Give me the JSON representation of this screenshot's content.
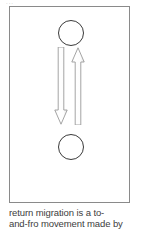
{
  "artifact": {
    "text": "..."
  },
  "figure": {
    "frame": {
      "border_color": "#8a8a8a",
      "background": "#ffffff"
    },
    "nodes": [
      {
        "name": "origin",
        "shape": "circle",
        "label": "",
        "position": "top",
        "stroke_color": "#3a3a3a"
      },
      {
        "name": "destination",
        "shape": "circle",
        "label": "",
        "position": "bottom",
        "stroke_color": "#3a3a3a"
      }
    ],
    "arrows": [
      {
        "name": "outward-migration",
        "direction": "down",
        "from": "origin",
        "to": "destination",
        "label": "",
        "stroke_color": "#9a9a9a",
        "fill": "#ffffff"
      },
      {
        "name": "return-migration",
        "direction": "up",
        "from": "destination",
        "to": "origin",
        "label": "",
        "stroke_color": "#9a9a9a",
        "fill": "#ffffff"
      }
    ]
  },
  "caption": {
    "line1": "return migration is a to-",
    "line2": "and-fro movement made by",
    "text_color": "#3d3d3d"
  }
}
